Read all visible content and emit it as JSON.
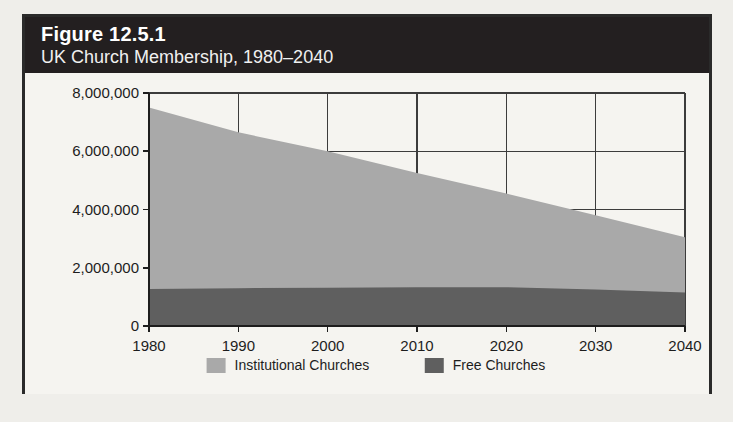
{
  "figure": {
    "number": "Figure 12.5.1",
    "subtitle": "UK Church Membership, 1980–2040"
  },
  "colors": {
    "header_background": "#231f20",
    "header_text": "#ffffff",
    "panel_background": "#f5f4f0",
    "frame": "#2a2a2a",
    "institutional": "#a9a9a9",
    "free": "#5f5f5f",
    "axis": "#1d1d1d",
    "gridline": "#3c3c3c"
  },
  "chart_data": {
    "type": "area",
    "stacked": true,
    "title": "UK Church Membership, 1980–2040",
    "xlabel": "",
    "ylabel": "",
    "x": [
      1980,
      1990,
      2000,
      2010,
      2020,
      2030,
      2040
    ],
    "xtick_labels": [
      "1980",
      "1990",
      "2000",
      "2010",
      "2020",
      "2030",
      "2040"
    ],
    "xlim": [
      1980,
      2040
    ],
    "ylim": [
      0,
      8000000
    ],
    "yticks": [
      0,
      2000000,
      4000000,
      6000000,
      8000000
    ],
    "ytick_labels": [
      "0",
      "2,000,000",
      "4,000,000",
      "6,000,000",
      "8,000,000"
    ],
    "grid": true,
    "legend_position": "bottom",
    "series": [
      {
        "name": "Free Churches",
        "color": "#5f5f5f",
        "values": [
          1270000,
          1300000,
          1310000,
          1330000,
          1330000,
          1250000,
          1150000
        ]
      },
      {
        "name": "Institutional Churches",
        "color": "#a9a9a9",
        "values": [
          6230000,
          5350000,
          4690000,
          3920000,
          3220000,
          2550000,
          1900000
        ]
      }
    ],
    "totals": [
      7500000,
      6650000,
      6000000,
      5250000,
      4550000,
      3800000,
      3050000
    ]
  },
  "legend": {
    "items": [
      {
        "label": "Institutional Churches",
        "color": "#a9a9a9"
      },
      {
        "label": "Free Churches",
        "color": "#5f5f5f"
      }
    ]
  }
}
